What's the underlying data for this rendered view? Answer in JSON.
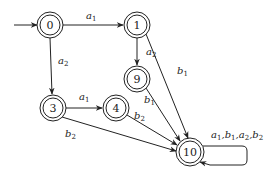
{
  "diagram": {
    "type": "state-transition-automaton",
    "start_state": "0",
    "nodes": [
      {
        "id": "0",
        "label": "0",
        "x": 50,
        "y": 25,
        "accepting": true
      },
      {
        "id": "1",
        "label": "1",
        "x": 137,
        "y": 25,
        "accepting": true
      },
      {
        "id": "9",
        "label": "9",
        "x": 137,
        "y": 79,
        "accepting": true
      },
      {
        "id": "3",
        "label": "3",
        "x": 53,
        "y": 108,
        "accepting": true
      },
      {
        "id": "4",
        "label": "4",
        "x": 116,
        "y": 108,
        "accepting": true
      },
      {
        "id": "10",
        "label": "10",
        "x": 190,
        "y": 152,
        "accepting": true
      }
    ],
    "edges": [
      {
        "from": "0",
        "to": "1",
        "label": "a1",
        "base": "a",
        "sub": "1"
      },
      {
        "from": "0",
        "to": "3",
        "label": "a2",
        "base": "a",
        "sub": "2"
      },
      {
        "from": "1",
        "to": "9",
        "label": "a2",
        "base": "a",
        "sub": "2"
      },
      {
        "from": "1",
        "to": "10",
        "label": "b1",
        "base": "b",
        "sub": "1"
      },
      {
        "from": "9",
        "to": "10",
        "label": "b1",
        "base": "b",
        "sub": "1"
      },
      {
        "from": "3",
        "to": "4",
        "label": "a1",
        "base": "a",
        "sub": "1"
      },
      {
        "from": "4",
        "to": "10",
        "label": "b2",
        "base": "b",
        "sub": "2"
      },
      {
        "from": "3",
        "to": "10",
        "label": "b2",
        "base": "b",
        "sub": "2"
      },
      {
        "from": "10",
        "to": "10",
        "label": "a1,b1,a2,b2"
      }
    ],
    "self_loop_label": {
      "parts": [
        {
          "base": "a",
          "sub": "1"
        },
        {
          "base": "b",
          "sub": "1"
        },
        {
          "base": "a",
          "sub": "2"
        },
        {
          "base": "b",
          "sub": "2"
        }
      ],
      "separator": ","
    }
  }
}
